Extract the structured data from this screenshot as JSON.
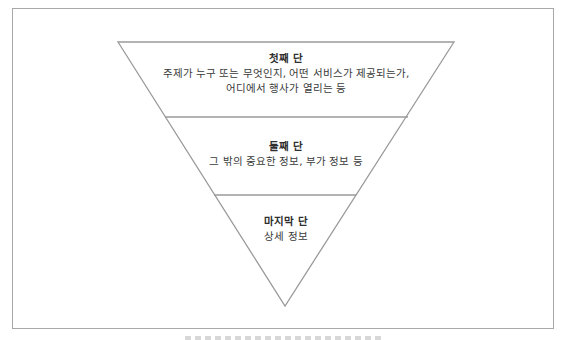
{
  "diagram": {
    "type": "inverted-pyramid",
    "tiers": [
      {
        "title": "첫째 단",
        "lines": [
          "주제가 누구 또는 무엇인지, 어떤 서비스가 제공되는가,",
          "어디에서 행사가 열리는 등"
        ]
      },
      {
        "title": "둘째 단",
        "lines": [
          "그 밖의 중요한 정보, 부가 정보 등"
        ]
      },
      {
        "title": "마지막 단",
        "lines": [
          "상세 정보"
        ]
      }
    ],
    "colors": {
      "line": "#9a9a9a",
      "frame": "#a8a8a8",
      "text": "#3a3a3a"
    }
  }
}
